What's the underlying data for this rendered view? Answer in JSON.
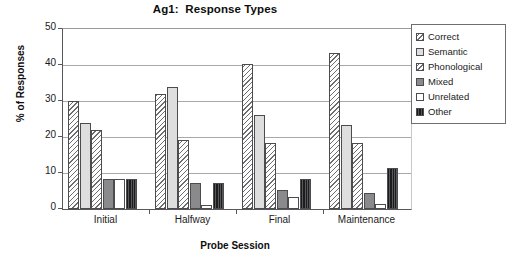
{
  "chart_data": {
    "type": "bar",
    "title": "Ag1:  Response Types",
    "xlabel": "Probe Session",
    "ylabel": "% of Responses",
    "categories": [
      "Initial",
      "Halfway",
      "Final",
      "Maintenance"
    ],
    "ylim": [
      0,
      50
    ],
    "yticks": [
      0,
      10,
      20,
      30,
      40,
      50
    ],
    "grid": true,
    "legend_position": "right",
    "series": [
      {
        "name": "Correct",
        "swatch": "diagonal-hatch-light",
        "color": "#ffffff",
        "values": [
          30.0,
          32.0,
          40.3,
          43.3
        ]
      },
      {
        "name": "Semantic",
        "swatch": "solid-light-gray",
        "color": "#dedede",
        "values": [
          24.0,
          34.0,
          26.2,
          23.2
        ]
      },
      {
        "name": "Phonological",
        "swatch": "diagonal-hatch-light",
        "color": "#ffffff",
        "values": [
          22.0,
          19.2,
          18.3,
          18.3
        ]
      },
      {
        "name": "Mixed",
        "swatch": "solid-medium-gray",
        "color": "#8a8a8c",
        "values": [
          8.3,
          7.2,
          5.4,
          4.4
        ]
      },
      {
        "name": "Unrelated",
        "swatch": "solid-white",
        "color": "#ffffff",
        "values": [
          8.3,
          1.2,
          3.3,
          1.3
        ]
      },
      {
        "name": "Other",
        "swatch": "solid-dark",
        "color": "#3a3a3c",
        "values": [
          8.3,
          7.2,
          8.4,
          11.5
        ]
      }
    ]
  }
}
